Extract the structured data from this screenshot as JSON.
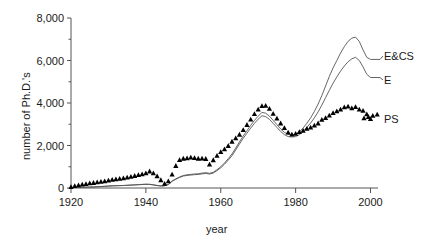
{
  "chart_data": {
    "type": "line",
    "title": "",
    "xlabel": "year",
    "ylabel": "number of Ph.D.'s",
    "xlim": [
      1920,
      2002
    ],
    "ylim": [
      0,
      8000
    ],
    "grid": false,
    "legend_position": "right-of-plot",
    "xticks": [
      "1920",
      "1940",
      "1960",
      "1980",
      "2000"
    ],
    "xtick_values": [
      1920,
      1940,
      1960,
      1980,
      2000
    ],
    "yticks": [
      "0",
      "2,000",
      "4,000",
      "6,000",
      "8,000"
    ],
    "ytick_values": [
      0,
      2000,
      4000,
      6000,
      8000
    ],
    "x": [
      1920,
      1921,
      1922,
      1923,
      1924,
      1925,
      1926,
      1927,
      1928,
      1929,
      1930,
      1931,
      1932,
      1933,
      1934,
      1935,
      1936,
      1937,
      1938,
      1939,
      1940,
      1941,
      1942,
      1943,
      1944,
      1945,
      1946,
      1947,
      1948,
      1949,
      1950,
      1951,
      1952,
      1953,
      1954,
      1955,
      1956,
      1957,
      1958,
      1959,
      1960,
      1961,
      1962,
      1963,
      1964,
      1965,
      1966,
      1967,
      1968,
      1969,
      1970,
      1971,
      1972,
      1973,
      1974,
      1975,
      1976,
      1977,
      1978,
      1979,
      1980,
      1981,
      1982,
      1983,
      1984,
      1985,
      1986,
      1987,
      1988,
      1989,
      1990,
      1991,
      1992,
      1993,
      1994,
      1995,
      1996,
      1997,
      1998,
      1999,
      2000
    ],
    "series": [
      {
        "name": "E&CS",
        "label": "E&CS",
        "style": "line",
        "color": "#555555",
        "values": [
          20,
          25,
          30,
          35,
          40,
          45,
          50,
          60,
          70,
          80,
          95,
          105,
          110,
          115,
          120,
          130,
          140,
          150,
          160,
          170,
          180,
          175,
          150,
          120,
          100,
          110,
          170,
          330,
          430,
          520,
          590,
          620,
          640,
          660,
          670,
          700,
          720,
          690,
          740,
          860,
          1000,
          1180,
          1380,
          1600,
          1880,
          2170,
          2450,
          2700,
          2950,
          3180,
          3380,
          3560,
          3520,
          3380,
          3180,
          2980,
          2780,
          2620,
          2520,
          2500,
          2530,
          2640,
          2820,
          3050,
          3300,
          3600,
          3950,
          4350,
          4800,
          5250,
          5650,
          6000,
          6350,
          6650,
          6900,
          7050,
          7100,
          6900,
          6500,
          6150,
          6050
        ]
      },
      {
        "name": "E",
        "label": "E",
        "style": "line",
        "color": "#555555",
        "values": [
          18,
          23,
          28,
          33,
          38,
          43,
          48,
          57,
          66,
          76,
          90,
          100,
          105,
          110,
          115,
          124,
          134,
          143,
          153,
          163,
          172,
          167,
          143,
          115,
          95,
          105,
          162,
          315,
          410,
          495,
          562,
          592,
          610,
          628,
          638,
          666,
          686,
          656,
          704,
          818,
          950,
          1120,
          1310,
          1520,
          1790,
          2070,
          2340,
          2580,
          2820,
          3040,
          3240,
          3400,
          3360,
          3230,
          3040,
          2850,
          2660,
          2510,
          2420,
          2400,
          2420,
          2510,
          2660,
          2850,
          3060,
          3300,
          3580,
          3900,
          4250,
          4600,
          4930,
          5230,
          5500,
          5740,
          5940,
          6080,
          6150,
          6000,
          5700,
          5350,
          5200
        ]
      },
      {
        "name": "PS",
        "label": "PS",
        "style": "markers",
        "marker": "triangle",
        "color": "#000000",
        "values": [
          60,
          100,
          140,
          170,
          200,
          230,
          250,
          280,
          300,
          330,
          360,
          400,
          420,
          440,
          470,
          500,
          540,
          580,
          620,
          660,
          700,
          790,
          700,
          560,
          380,
          210,
          330,
          640,
          1050,
          1330,
          1390,
          1410,
          1440,
          1420,
          1390,
          1400,
          1380,
          1110,
          1320,
          1530,
          1700,
          1830,
          1990,
          2190,
          2350,
          2520,
          2740,
          2980,
          3230,
          3490,
          3700,
          3870,
          3880,
          3740,
          3500,
          3280,
          3050,
          2830,
          2620,
          2530,
          2560,
          2640,
          2700,
          2800,
          2860,
          2950,
          3050,
          3220,
          3300,
          3420,
          3540,
          3620,
          3700,
          3810,
          3840,
          3760,
          3820,
          3700,
          3640,
          3480,
          3260
        ]
      }
    ]
  },
  "labels": {
    "ylabel": "number of Ph.D.'s",
    "xlabel": "year"
  }
}
